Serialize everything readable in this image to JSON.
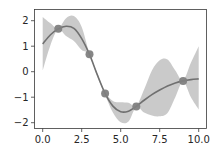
{
  "chart_data": {
    "type": "line",
    "title": "",
    "xlabel": "",
    "ylabel": "",
    "xlim": [
      -0.5,
      10.5
    ],
    "ylim": [
      -2.25,
      2.45
    ],
    "grid": false,
    "legend": null,
    "x_ticks": [
      0.0,
      2.5,
      5.0,
      7.5,
      10.0
    ],
    "x_tick_labels": [
      "0.0",
      "2.5",
      "5.0",
      "7.5",
      "10.0"
    ],
    "y_ticks": [
      2,
      1,
      0,
      -1,
      -2
    ],
    "y_tick_labels": [
      "2",
      "1",
      "0",
      "−1",
      "−2"
    ],
    "series": [
      {
        "name": "mean prediction",
        "kind": "line",
        "color": "#707070",
        "x": [
          0.0,
          0.5,
          1.0,
          1.5,
          2.0,
          2.5,
          3.0,
          3.5,
          4.0,
          4.5,
          5.0,
          5.5,
          6.0,
          6.5,
          7.0,
          7.5,
          8.0,
          8.5,
          9.0,
          9.5,
          10.0
        ],
        "y": [
          1.09,
          1.45,
          1.68,
          1.78,
          1.7,
          1.3,
          0.68,
          -0.12,
          -0.85,
          -1.35,
          -1.57,
          -1.55,
          -1.36,
          -1.12,
          -0.9,
          -0.72,
          -0.56,
          -0.44,
          -0.36,
          -0.31,
          -0.28
        ]
      },
      {
        "name": "confidence interval",
        "kind": "area",
        "color": "#bdbdbd",
        "x": [
          0.0,
          0.5,
          1.0,
          1.5,
          2.0,
          2.5,
          3.0,
          3.5,
          4.0,
          4.5,
          5.0,
          5.5,
          6.0,
          6.5,
          7.0,
          7.5,
          8.0,
          8.5,
          9.0,
          9.5,
          10.0
        ],
        "upper": [
          2.15,
          1.9,
          1.7,
          2.1,
          2.18,
          1.75,
          0.7,
          -0.05,
          -0.8,
          -1.15,
          -1.2,
          -1.22,
          -1.34,
          -0.7,
          0.05,
          0.45,
          0.48,
          0.05,
          -0.34,
          0.35,
          1.0
        ],
        "lower": [
          0.05,
          1.05,
          1.66,
          1.4,
          1.2,
          0.85,
          0.66,
          -0.2,
          -0.9,
          -1.6,
          -1.98,
          -1.95,
          -1.38,
          -1.6,
          -1.72,
          -1.75,
          -1.62,
          -1.0,
          -0.38,
          -1.0,
          -1.48
        ]
      },
      {
        "name": "observations",
        "kind": "scatter",
        "color": "#808080",
        "x": [
          1.0,
          3.0,
          4.0,
          6.0,
          9.0
        ],
        "y": [
          1.68,
          0.68,
          -0.85,
          -1.36,
          -0.36
        ]
      }
    ]
  }
}
